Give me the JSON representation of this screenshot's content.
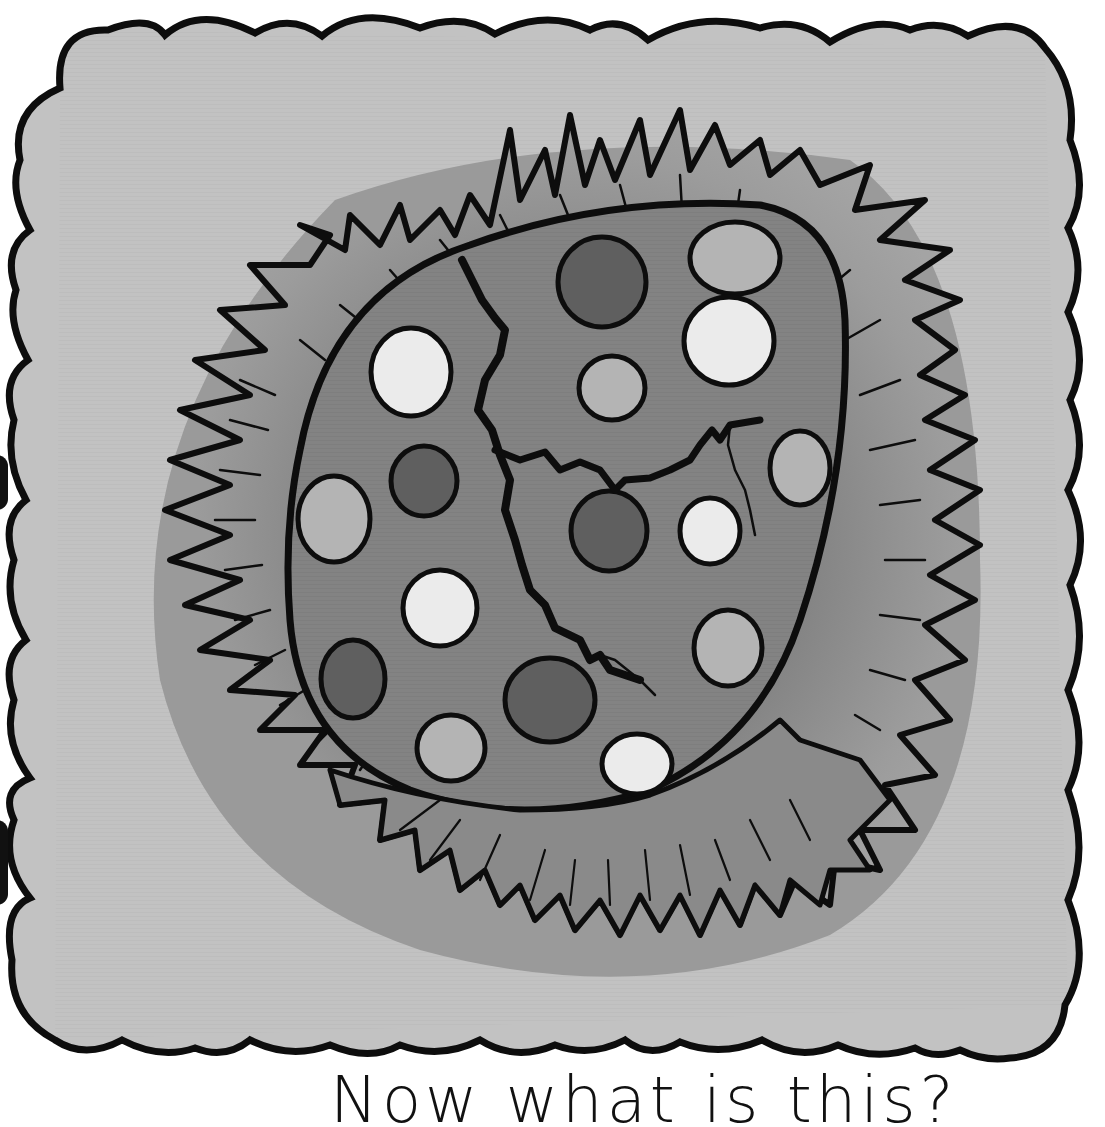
{
  "page": {
    "caption": "Now what is this?",
    "caption_visible_state": "partially cut off at bottom edge"
  },
  "illustration": {
    "subject": "cracked spotted egg in a grass nest",
    "card": {
      "shape": "scalloped-edge square",
      "fill": "#c2c2c2",
      "outline": "#0d0d0d"
    },
    "nest": {
      "shadow_fill": "#9a9a9a",
      "grass_fill": "#8c8c8c",
      "outline": "#0d0d0d"
    },
    "egg": {
      "fill": "#838383",
      "outline": "#0d0d0d",
      "cracks": 2,
      "spot_colors": {
        "dark": "#5f5f5f",
        "medium": "#b4b4b4",
        "light": "#ebebeb"
      },
      "spots": [
        {
          "cx": 602,
          "cy": 282,
          "rx": 44,
          "ry": 45,
          "tone": "dark"
        },
        {
          "cx": 735,
          "cy": 258,
          "rx": 45,
          "ry": 36,
          "tone": "medium"
        },
        {
          "cx": 411,
          "cy": 372,
          "rx": 40,
          "ry": 44,
          "tone": "light"
        },
        {
          "cx": 729,
          "cy": 341,
          "rx": 45,
          "ry": 44,
          "tone": "light"
        },
        {
          "cx": 612,
          "cy": 388,
          "rx": 33,
          "ry": 32,
          "tone": "medium"
        },
        {
          "cx": 424,
          "cy": 481,
          "rx": 33,
          "ry": 35,
          "tone": "dark"
        },
        {
          "cx": 800,
          "cy": 468,
          "rx": 30,
          "ry": 37,
          "tone": "medium"
        },
        {
          "cx": 609,
          "cy": 531,
          "rx": 38,
          "ry": 40,
          "tone": "dark"
        },
        {
          "cx": 710,
          "cy": 531,
          "rx": 30,
          "ry": 33,
          "tone": "light"
        },
        {
          "cx": 334,
          "cy": 519,
          "rx": 36,
          "ry": 43,
          "tone": "medium"
        },
        {
          "cx": 440,
          "cy": 608,
          "rx": 37,
          "ry": 38,
          "tone": "light"
        },
        {
          "cx": 728,
          "cy": 648,
          "rx": 34,
          "ry": 38,
          "tone": "medium"
        },
        {
          "cx": 353,
          "cy": 679,
          "rx": 32,
          "ry": 39,
          "tone": "dark"
        },
        {
          "cx": 550,
          "cy": 700,
          "rx": 45,
          "ry": 42,
          "tone": "dark"
        },
        {
          "cx": 451,
          "cy": 748,
          "rx": 34,
          "ry": 33,
          "tone": "medium"
        },
        {
          "cx": 637,
          "cy": 764,
          "rx": 35,
          "ry": 30,
          "tone": "light"
        }
      ]
    }
  }
}
